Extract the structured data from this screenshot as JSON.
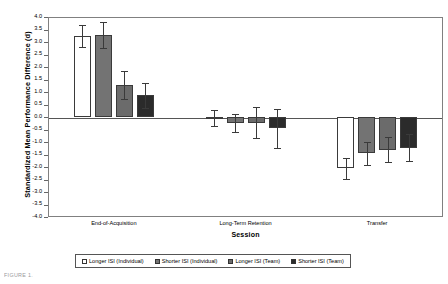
{
  "chart_data": {
    "type": "bar",
    "title": "",
    "xlabel": "Session",
    "ylabel": "Standardized Mean Performance Difference (d)",
    "ylim": [
      -4.0,
      4.0
    ],
    "grid": false,
    "legend_position": "bottom",
    "categories": [
      "End-of-Acquisition",
      "Long-Term Retention",
      "Transfer"
    ],
    "yticks": [
      "4.0",
      "3.5",
      "3.0",
      "2.5",
      "2.0",
      "1.5",
      "1.0",
      "0.5",
      "0.0",
      "-0.5",
      "-1.0",
      "-1.5",
      "-2.0",
      "-2.5",
      "-3.0",
      "-3.5",
      "-4.0"
    ],
    "ytick_values": [
      4.0,
      3.5,
      3.0,
      2.5,
      2.0,
      1.5,
      1.0,
      0.5,
      0.0,
      -0.5,
      -1.0,
      -1.5,
      -2.0,
      -2.5,
      -3.0,
      -3.5,
      -4.0
    ],
    "series": [
      {
        "name": "Longer ISI (Individual)",
        "color": "#ffffff",
        "values": [
          3.24,
          -0.05,
          -2.05
        ],
        "errors": [
          0.45,
          0.32,
          0.42
        ]
      },
      {
        "name": "Shorter ISI (Individual)",
        "color": "#737373",
        "values": [
          3.27,
          -0.25,
          -1.45
        ],
        "errors": [
          0.52,
          0.36,
          0.45
        ]
      },
      {
        "name": "Longer ISI (Team)",
        "color": "#6b6b6b",
        "values": [
          1.28,
          -0.22,
          -1.3
        ],
        "errors": [
          0.55,
          0.62,
          0.5
        ]
      },
      {
        "name": "Shorter ISI (Team)",
        "color": "#2b2b2b",
        "values": [
          0.88,
          -0.45,
          -1.22
        ],
        "errors": [
          0.5,
          0.78,
          0.55
        ]
      }
    ]
  },
  "legend": {
    "items": [
      {
        "label": "Longer ISI (Individual)",
        "color": "#ffffff"
      },
      {
        "label": "Shorter ISI (Individual)",
        "color": "#737373"
      },
      {
        "label": "Longer ISI (Team)",
        "color": "#6b6b6b"
      },
      {
        "label": "Shorter ISI (Team)",
        "color": "#2b2b2b"
      }
    ]
  },
  "caption": {
    "fragment": "FIGURE 1."
  }
}
